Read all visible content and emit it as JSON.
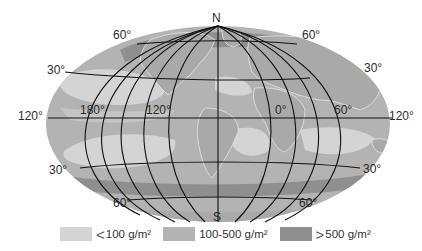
{
  "map": {
    "projection": "elliptical world map",
    "pole_labels": {
      "north": "N",
      "south": "S"
    },
    "latitude_labels": {
      "top_left_60": "60°",
      "top_right_60": "60°",
      "upper_left_30": "30°",
      "upper_right_30": "30°",
      "lower_left_30": "30°",
      "lower_right_30": "30°",
      "bottom_left_60": "60°",
      "bottom_right_60": "60°"
    },
    "longitude_labels": {
      "left_edge_120": "120°",
      "l180": "180°",
      "l120w": "120°",
      "l0": "0°",
      "l60e": "60°",
      "right_edge_120": "120°"
    },
    "colors": {
      "land": "#a9a9a9",
      "low": "#d4d4d4",
      "mid": "#b3b3b3",
      "high": "#8f8f8f",
      "grid": "#111111"
    }
  },
  "legend": {
    "items": [
      {
        "symbol": "<",
        "label": "100 g/m²",
        "color": "#d4d4d4"
      },
      {
        "symbol": "",
        "label": "100-500 g/m²",
        "color": "#b3b3b3"
      },
      {
        "symbol": ">",
        "label": "500 g/m²",
        "color": "#8f8f8f"
      }
    ]
  }
}
